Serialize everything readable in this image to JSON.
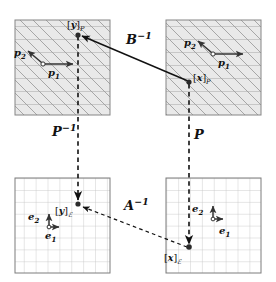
{
  "figure": {
    "type": "commutative-diagram"
  },
  "panels": [
    {
      "id": "top-left",
      "name": "skewed-basis-plane-y",
      "grid": "skewed",
      "x": 15,
      "y": 20,
      "w": 95,
      "h": 95,
      "point_label": "[y]",
      "point_subscript": "P",
      "point_x": 77,
      "point_y": 33,
      "origin_x": 43,
      "origin_y": 64,
      "vectors": [
        {
          "name": "p1",
          "label": "p",
          "sub": "1",
          "dx": 32,
          "dy": 0,
          "label_x": 51,
          "label_y": 70
        },
        {
          "name": "p2",
          "label": "p",
          "sub": "2",
          "dx": -18,
          "dy": -15,
          "label_x": 16,
          "label_y": 51
        }
      ]
    },
    {
      "id": "top-right",
      "name": "skewed-basis-plane-x",
      "grid": "skewed",
      "x": 166,
      "y": 20,
      "w": 95,
      "h": 95,
      "point_label": "[x]",
      "point_subscript": "P",
      "point_x": 189,
      "point_y": 82,
      "origin_x": 213,
      "origin_y": 54,
      "vectors": [
        {
          "name": "p1",
          "label": "p",
          "sub": "1",
          "dx": 32,
          "dy": 0,
          "label_x": 221,
          "label_y": 60
        },
        {
          "name": "p2",
          "label": "p",
          "sub": "2",
          "dx": -18,
          "dy": -15,
          "label_x": 186,
          "label_y": 41
        }
      ]
    },
    {
      "id": "bottom-left",
      "name": "standard-basis-plane-y",
      "grid": "rectangular",
      "x": 15,
      "y": 178,
      "w": 95,
      "h": 95,
      "point_label": "[y]",
      "point_subscript": "E",
      "point_x": 77,
      "point_y": 204,
      "origin_x": 49,
      "origin_y": 227,
      "vectors": [
        {
          "name": "e1",
          "label": "e",
          "sub": "1",
          "dx": 12,
          "dy": 0,
          "label_x": 49,
          "label_y": 233
        },
        {
          "name": "e2",
          "label": "e",
          "sub": "2",
          "dx": 0,
          "dy": -14,
          "label_x": 31,
          "label_y": 211
        }
      ]
    },
    {
      "id": "bottom-right",
      "name": "standard-basis-plane-x",
      "grid": "rectangular",
      "x": 166,
      "y": 178,
      "w": 95,
      "h": 95,
      "point_label": "[x]",
      "point_subscript": "E",
      "point_x": 189,
      "point_y": 248,
      "origin_x": 213,
      "origin_y": 219,
      "vectors": [
        {
          "name": "e1",
          "label": "e",
          "sub": "1",
          "dx": 12,
          "dy": 0,
          "label_x": 213,
          "label_y": 226
        },
        {
          "name": "e2",
          "label": "e",
          "sub": "2",
          "dx": 0,
          "dy": -14,
          "label_x": 195,
          "label_y": 203
        }
      ]
    }
  ],
  "arrows": [
    {
      "name": "B-inverse-arrow",
      "label": "B",
      "exponent": "−1",
      "style": "solid",
      "from_x": 189,
      "from_y": 82,
      "to_x": 79,
      "to_y": 35,
      "label_x": 130,
      "label_y": 37
    },
    {
      "name": "P-inverse-arrow",
      "label": "P",
      "exponent": "−1",
      "style": "dashed",
      "from_x": 78,
      "from_y": 115,
      "to_x": 78,
      "to_y": 203,
      "label_x": 57,
      "label_y": 129
    },
    {
      "name": "P-arrow",
      "label": "P",
      "exponent": "",
      "style": "dashed",
      "from_x": 189,
      "from_y": 84,
      "to_x": 189,
      "to_y": 247,
      "label_x": 196,
      "label_y": 132
    },
    {
      "name": "A-inverse-arrow",
      "label": "A",
      "exponent": "−1",
      "style": "dashed",
      "from_x": 189,
      "from_y": 247,
      "to_x": 80,
      "to_y": 206,
      "label_x": 128,
      "label_y": 203
    }
  ],
  "symbols": {
    "bracket_open": "[",
    "bracket_close": "]",
    "basis_P": "P",
    "basis_E": "ℰ"
  },
  "colors": {
    "grid_skewed_fill": "#e8e8e8",
    "grid_line": "#9a9a9a",
    "panel_border": "#808080",
    "grid_line_light": "#bdbdbd",
    "arrow": "#000000",
    "point": "#222222",
    "text": "#111111"
  }
}
